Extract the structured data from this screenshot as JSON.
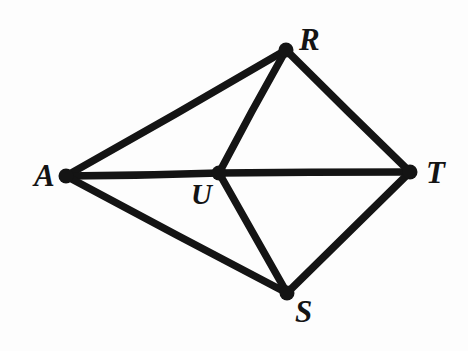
{
  "figure": {
    "kind": "hand-drawn-graph-diagram",
    "background_color": "#fdfdfd",
    "ink_color": "#141414",
    "width": 468,
    "height": 351,
    "edge_stroke_width": 7.5,
    "vertex_dot_radius": 7.5
  },
  "graph": {
    "vertices": [
      {
        "id": "A",
        "label": "A",
        "x": 66,
        "y": 176,
        "label_x": 34,
        "label_y": 160,
        "font_size": 31
      },
      {
        "id": "R",
        "label": "R",
        "x": 286,
        "y": 50,
        "label_x": 299,
        "label_y": 24,
        "font_size": 31
      },
      {
        "id": "T",
        "label": "T",
        "x": 410,
        "y": 172,
        "label_x": 426,
        "label_y": 157,
        "font_size": 31
      },
      {
        "id": "S",
        "label": "S",
        "x": 287,
        "y": 293,
        "label_x": 295,
        "label_y": 296,
        "font_size": 31
      },
      {
        "id": "U",
        "label": "U",
        "x": 219,
        "y": 173,
        "label_x": 191,
        "label_y": 180,
        "font_size": 29
      }
    ],
    "edges": [
      {
        "id": "A-R",
        "from": "A",
        "to": "R"
      },
      {
        "id": "A-U",
        "from": "A",
        "to": "U"
      },
      {
        "id": "U-T",
        "from": "U",
        "to": "T"
      },
      {
        "id": "A-S",
        "from": "A",
        "to": "S"
      },
      {
        "id": "R-U",
        "from": "R",
        "to": "U"
      },
      {
        "id": "R-T",
        "from": "R",
        "to": "T"
      },
      {
        "id": "U-S",
        "from": "U",
        "to": "S"
      },
      {
        "id": "S-T",
        "from": "S",
        "to": "T"
      }
    ]
  }
}
